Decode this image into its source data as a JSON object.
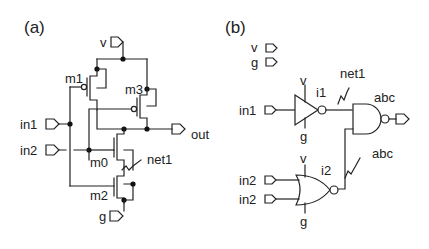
{
  "panels": {
    "a": {
      "title": "(a)",
      "pins": {
        "vdd": "v",
        "gnd": "g",
        "in1": "in1",
        "in2": "in2",
        "out": "out"
      },
      "transistors": {
        "m0": "m0",
        "m1": "m1",
        "m2": "m2",
        "m3": "m3"
      },
      "net_label": "net1"
    },
    "b": {
      "title": "(b)",
      "global_pins": {
        "vdd": "v",
        "gnd": "g"
      },
      "inverter": {
        "instance": "i1",
        "supply": "v",
        "ground": "g",
        "input_pin": "in1"
      },
      "nor_gate": {
        "instance": "i2",
        "supply": "v",
        "ground": "g",
        "input_pin_1": "in2",
        "input_pin_2": "in2"
      },
      "nand_gate": {
        "label": "abc"
      },
      "net_label_1": "net1",
      "net_label_2": "abc"
    }
  }
}
